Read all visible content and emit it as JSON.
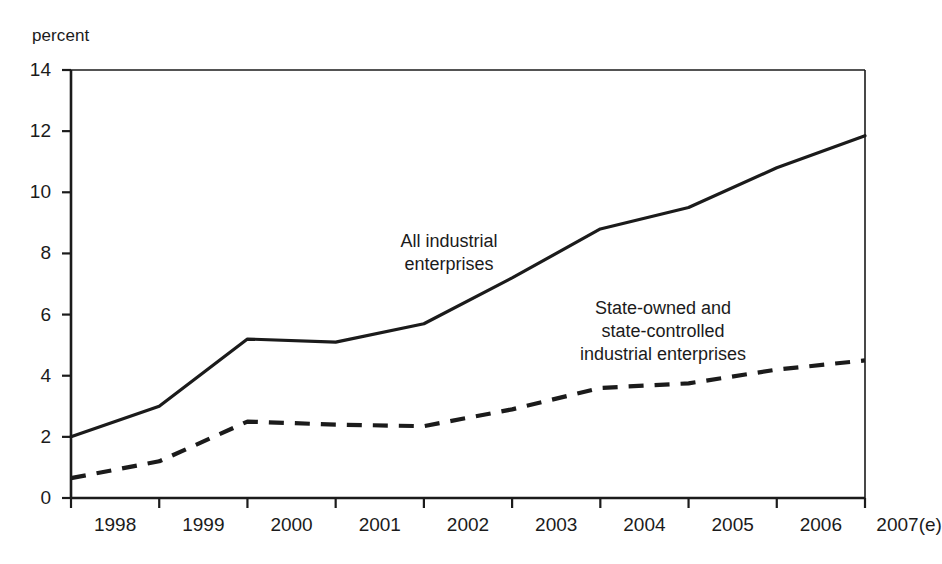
{
  "chart_data": {
    "type": "line",
    "title": "",
    "subtitle": "",
    "xlabel": "",
    "ylabel": "percent",
    "ylim": [
      0,
      14
    ],
    "yticks": [
      0,
      2,
      4,
      6,
      8,
      10,
      12,
      14
    ],
    "ytick_labels": [
      "0",
      "2",
      "4",
      "6",
      "8",
      "10",
      "12",
      "14"
    ],
    "categories": [
      "1998",
      "1999",
      "2000",
      "2001",
      "2002",
      "2003",
      "2004",
      "2005",
      "2006",
      "2007(e)"
    ],
    "grid": false,
    "legend_position": "inline-annotations",
    "series": [
      {
        "name": "All industrial enterprises",
        "style": "solid",
        "color": "#1b1b1b",
        "values": [
          2.0,
          3.0,
          5.2,
          5.1,
          5.7,
          7.2,
          8.8,
          9.5,
          10.8,
          11.85
        ]
      },
      {
        "name": "State-owned and state-controlled industrial enterprises",
        "style": "dashed",
        "color": "#1b1b1b",
        "values": [
          0.65,
          1.2,
          2.5,
          2.4,
          2.35,
          2.9,
          3.6,
          3.75,
          4.2,
          4.5
        ]
      }
    ],
    "annotations": [
      {
        "id": "annot-all-industrial",
        "text": "All industrial\nenterprises",
        "x_px": 449,
        "y_px": 230
      },
      {
        "id": "annot-state-owned",
        "text": "State-owned and\nstate-controlled\nindustrial enterprises",
        "x_px": 663,
        "y_px": 297
      }
    ]
  },
  "axis": {
    "unit_label": "percent"
  },
  "colors": {
    "ink": "#1b1b1b",
    "background": "#ffffff",
    "axis": "#1b1b1b"
  }
}
